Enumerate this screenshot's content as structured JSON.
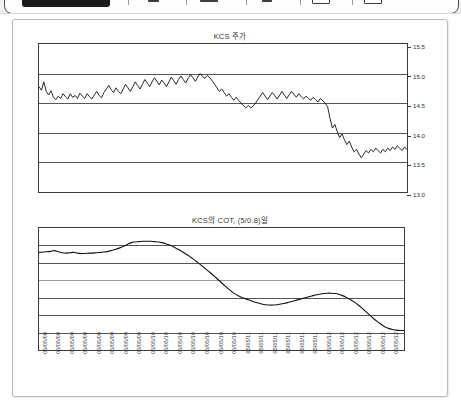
{
  "toolbar": {
    "name": "viewer-toolbar-cropped",
    "separators": [
      128,
      186,
      246,
      300,
      352
    ],
    "icons": [
      {
        "name": "page-icon",
        "x": 148,
        "w": 11
      },
      {
        "name": "page-wide-icon",
        "x": 200,
        "w": 18
      },
      {
        "name": "cursor-icon",
        "x": 262,
        "w": 10
      },
      {
        "name": "zoom-out-icon",
        "x": 312,
        "w": 16
      },
      {
        "name": "zoom-in-icon",
        "x": 364,
        "w": 16
      }
    ]
  },
  "charts": [
    {
      "id": "price",
      "title": "KCS 주가"
    },
    {
      "id": "cot",
      "title": "KCS의 COT, (5/0.8)일"
    }
  ],
  "chart_data": [
    {
      "type": "line",
      "id": "price",
      "title": "KCS 주가",
      "xlabel": "",
      "ylabel": "",
      "ylim": [
        13.0,
        15.5
      ],
      "yticks": [
        "15.5",
        "15.0",
        "14.5",
        "14.0",
        "13.5",
        "13.0"
      ],
      "ytick_values": [
        15.5,
        15.0,
        14.5,
        14.0,
        13.5,
        13.0
      ],
      "grid": true,
      "legend": "none",
      "series": [
        {
          "name": "KCS 주가",
          "color": "#111111",
          "values": [
            14.78,
            14.72,
            14.86,
            14.7,
            14.64,
            14.71,
            14.6,
            14.56,
            14.62,
            14.58,
            14.66,
            14.61,
            14.57,
            14.66,
            14.6,
            14.63,
            14.58,
            14.67,
            14.62,
            14.58,
            14.66,
            14.61,
            14.57,
            14.64,
            14.7,
            14.63,
            14.59,
            14.68,
            14.74,
            14.8,
            14.73,
            14.68,
            14.76,
            14.7,
            14.66,
            14.74,
            14.82,
            14.76,
            14.7,
            14.78,
            14.86,
            14.8,
            14.74,
            14.82,
            14.9,
            14.84,
            14.78,
            14.86,
            14.93,
            14.87,
            14.81,
            14.89,
            14.84,
            14.78,
            14.86,
            14.94,
            14.88,
            14.82,
            14.9,
            14.96,
            14.9,
            14.84,
            14.92,
            14.98,
            14.93,
            14.87,
            14.94,
            15.0,
            14.95,
            14.92,
            14.97,
            14.93,
            14.88,
            14.82,
            14.76,
            14.7,
            14.74,
            14.68,
            14.62,
            14.66,
            14.6,
            14.55,
            14.6,
            14.55,
            14.5,
            14.46,
            14.42,
            14.46,
            14.42,
            14.45,
            14.5,
            14.56,
            14.62,
            14.68,
            14.62,
            14.56,
            14.62,
            14.68,
            14.63,
            14.57,
            14.63,
            14.7,
            14.64,
            14.58,
            14.64,
            14.7,
            14.65,
            14.6,
            14.66,
            14.61,
            14.57,
            14.62,
            14.58,
            14.55,
            14.6,
            14.56,
            14.52,
            14.58,
            14.54,
            14.5,
            14.44,
            14.24,
            14.08,
            14.14,
            14.02,
            13.92,
            13.98,
            13.88,
            13.8,
            13.86,
            13.76,
            13.68,
            13.72,
            13.64,
            13.58,
            13.64,
            13.7,
            13.66,
            13.72,
            13.68,
            13.74,
            13.7,
            13.66,
            13.72,
            13.68,
            13.74,
            13.7,
            13.76,
            13.72,
            13.78,
            13.74,
            13.7,
            13.76,
            13.72
          ]
        }
      ]
    },
    {
      "type": "line",
      "id": "cot",
      "title": "KCS의 COT, (5/0.8)일",
      "xlabel": "",
      "ylabel": "",
      "ylim": [
        -20.0,
        15.0
      ],
      "yticks": [
        "15.0%",
        "10.0%",
        "5.0%",
        "0.0%",
        "-5.0%",
        "-10.0%",
        "-15.0%",
        "-20.0%"
      ],
      "ytick_values": [
        15.0,
        10.0,
        5.0,
        0.0,
        -5.0,
        -10.0,
        -15.0,
        -20.0
      ],
      "grid": true,
      "legend": "none",
      "series": [
        {
          "name": "COT",
          "color": "#111111",
          "values": [
            8.0,
            8.1,
            8.2,
            8.3,
            8.5,
            8.2,
            7.9,
            7.8,
            7.9,
            8.0,
            7.8,
            7.7,
            7.7,
            7.8,
            7.8,
            7.9,
            8.0,
            8.1,
            8.3,
            8.6,
            8.9,
            9.3,
            9.8,
            10.3,
            10.8,
            11.0,
            11.1,
            11.2,
            11.2,
            11.2,
            11.1,
            11.0,
            10.8,
            10.5,
            10.1,
            9.6,
            9.0,
            8.4,
            7.7,
            7.0,
            6.2,
            5.4,
            4.5,
            3.6,
            2.7,
            1.8,
            0.8,
            -0.2,
            -1.2,
            -2.2,
            -3.1,
            -3.9,
            -4.5,
            -5.0,
            -5.4,
            -5.8,
            -6.2,
            -6.5,
            -6.8,
            -7.0,
            -7.1,
            -7.1,
            -7.0,
            -6.8,
            -6.6,
            -6.3,
            -6.0,
            -5.7,
            -5.4,
            -5.1,
            -4.8,
            -4.5,
            -4.2,
            -4.0,
            -3.8,
            -3.7,
            -3.7,
            -3.8,
            -4.0,
            -4.4,
            -4.9,
            -5.5,
            -6.2,
            -7.0,
            -7.9,
            -8.9,
            -9.9,
            -10.9,
            -11.8,
            -12.6,
            -13.3,
            -13.8,
            -14.1,
            -14.3,
            -14.4,
            -14.4
          ]
        }
      ]
    }
  ],
  "xaxis": {
    "labels": [
      "05/05/08",
      "05/05/08",
      "05/05/09",
      "05/05/09",
      "05/05/09",
      "05/05/09",
      "05/05/09",
      "05/05/09",
      "05/05/10",
      "05/05/10",
      "05/05/10",
      "05/05/10",
      "05/05/10",
      "05/05/10",
      "05/05/10",
      "05/05/11",
      "05/05/11",
      "05/05/11",
      "05/05/11",
      "05/05/11",
      "05/05/11",
      "05/05/12",
      "05/05/12",
      "05/05/12",
      "05/05/12",
      "05/05/12",
      "05/05/12"
    ]
  }
}
